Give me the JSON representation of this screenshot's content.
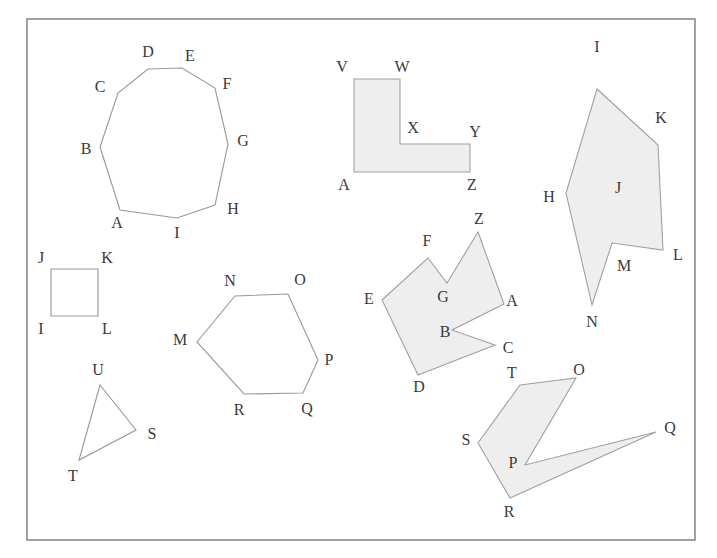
{
  "canvas": {
    "width": 717,
    "height": 558,
    "background": "#ffffff"
  },
  "frame": {
    "name": "diagram-border",
    "x": 27,
    "y": 19,
    "width": 668,
    "height": 521,
    "stroke": "#8a8a8a"
  },
  "style": {
    "outline_stroke": "#9a9a9a",
    "filled_fill": "#eeeeee",
    "filled_stroke": "#a0a0a0",
    "label_color": "#3a3a3a",
    "label_font_size": 16
  },
  "figures": [
    {
      "id": "nonagon",
      "name": "nonagon-outline",
      "filled": false,
      "vertices": [
        {
          "label": "A",
          "x": 120,
          "y": 210,
          "lx": 117,
          "ly": 224
        },
        {
          "label": "B",
          "x": 100,
          "y": 147,
          "lx": 86,
          "ly": 150
        },
        {
          "label": "C",
          "x": 118,
          "y": 93,
          "lx": 100,
          "ly": 88
        },
        {
          "label": "D",
          "x": 148,
          "y": 69,
          "lx": 148,
          "ly": 53
        },
        {
          "label": "E",
          "x": 182,
          "y": 68,
          "lx": 190,
          "ly": 57
        },
        {
          "label": "F",
          "x": 215,
          "y": 88,
          "lx": 227,
          "ly": 85
        },
        {
          "label": "G",
          "x": 228,
          "y": 144,
          "lx": 243,
          "ly": 142
        },
        {
          "label": "H",
          "x": 215,
          "y": 205,
          "lx": 233,
          "ly": 210
        },
        {
          "label": "I",
          "x": 177,
          "y": 218,
          "lx": 177,
          "ly": 234
        }
      ]
    },
    {
      "id": "l-shape",
      "name": "l-shape-filled",
      "filled": true,
      "vertices": [
        {
          "label": "V",
          "x": 354,
          "y": 79,
          "lx": 342,
          "ly": 68
        },
        {
          "label": "W",
          "x": 400,
          "y": 79,
          "lx": 402,
          "ly": 68
        },
        {
          "label": "X",
          "x": 400,
          "y": 144,
          "lx": 413,
          "ly": 129
        },
        {
          "label": "Y",
          "x": 470,
          "y": 144,
          "lx": 475,
          "ly": 133
        },
        {
          "label": "Z",
          "x": 470,
          "y": 172,
          "lx": 472,
          "ly": 186
        },
        {
          "label": "A",
          "x": 354,
          "y": 172,
          "lx": 344,
          "ly": 186
        }
      ]
    },
    {
      "id": "arrow-concave",
      "name": "arrow-concave-filled",
      "filled": true,
      "vertices": [
        {
          "label": "I",
          "x": 597,
          "y": 89,
          "lx": 597,
          "ly": 48
        },
        {
          "label": "K",
          "x": 658,
          "y": 145,
          "lx": 661,
          "ly": 119
        },
        {
          "label": "L",
          "x": 663,
          "y": 250,
          "lx": 678,
          "ly": 256
        },
        {
          "label": "M",
          "x": 612,
          "y": 243,
          "lx": 624,
          "ly": 267
        },
        {
          "label": "N",
          "x": 592,
          "y": 305,
          "lx": 592,
          "ly": 323
        },
        {
          "label": "H",
          "x": 566,
          "y": 193,
          "lx": 549,
          "ly": 198
        }
      ],
      "inner_label": {
        "label": "J",
        "lx": 618,
        "ly": 189
      }
    },
    {
      "id": "square",
      "name": "square-outline",
      "filled": false,
      "vertices": [
        {
          "label": "J",
          "x": 51,
          "y": 269,
          "lx": 41,
          "ly": 259
        },
        {
          "label": "K",
          "x": 98,
          "y": 269,
          "lx": 107,
          "ly": 259
        },
        {
          "label": "L",
          "x": 98,
          "y": 316,
          "lx": 107,
          "ly": 330
        },
        {
          "label": "I",
          "x": 51,
          "y": 316,
          "lx": 41,
          "ly": 330
        }
      ]
    },
    {
      "id": "triangle",
      "name": "triangle-outline",
      "filled": false,
      "vertices": [
        {
          "label": "U",
          "x": 100,
          "y": 385,
          "lx": 98,
          "ly": 371
        },
        {
          "label": "S",
          "x": 136,
          "y": 430,
          "lx": 152,
          "ly": 435
        },
        {
          "label": "T",
          "x": 79,
          "y": 460,
          "lx": 73,
          "ly": 477
        }
      ]
    },
    {
      "id": "hexagon",
      "name": "hexagon-outline",
      "filled": false,
      "vertices": [
        {
          "label": "M",
          "x": 197,
          "y": 342,
          "lx": 180,
          "ly": 341
        },
        {
          "label": "N",
          "x": 235,
          "y": 296,
          "lx": 230,
          "ly": 282
        },
        {
          "label": "O",
          "x": 288,
          "y": 294,
          "lx": 300,
          "ly": 281
        },
        {
          "label": "P",
          "x": 318,
          "y": 360,
          "lx": 329,
          "ly": 361
        },
        {
          "label": "Q",
          "x": 303,
          "y": 393,
          "lx": 307,
          "ly": 410
        },
        {
          "label": "R",
          "x": 244,
          "y": 394,
          "lx": 239,
          "ly": 411
        }
      ]
    },
    {
      "id": "star-polygon",
      "name": "star-polygon-filled",
      "filled": true,
      "vertices": [
        {
          "label": "Z",
          "x": 478,
          "y": 232,
          "lx": 479,
          "ly": 220
        },
        {
          "label": "F",
          "x": 428,
          "y": 258,
          "lx": 427,
          "ly": 242
        },
        {
          "label": "G",
          "x": 447,
          "y": 283,
          "lx": 443,
          "ly": 298
        },
        {
          "label": "E",
          "x": 382,
          "y": 300,
          "lx": 369,
          "ly": 300
        },
        {
          "label": "D",
          "x": 418,
          "y": 375,
          "lx": 419,
          "ly": 388
        },
        {
          "label": "C",
          "x": 495,
          "y": 345,
          "lx": 508,
          "ly": 349
        },
        {
          "label": "B",
          "x": 452,
          "y": 330,
          "lx": 445,
          "ly": 333
        },
        {
          "label": "A",
          "x": 504,
          "y": 304,
          "lx": 512,
          "ly": 302
        }
      ],
      "path_order": [
        "Z",
        "A",
        "B",
        "C",
        "D",
        "E",
        "F",
        "G"
      ]
    },
    {
      "id": "spike-polygon",
      "name": "spike-polygon-filled",
      "filled": true,
      "vertices": [
        {
          "label": "T",
          "x": 520,
          "y": 385,
          "lx": 512,
          "ly": 374
        },
        {
          "label": "O",
          "x": 576,
          "y": 378,
          "lx": 579,
          "ly": 371
        },
        {
          "label": "P",
          "x": 525,
          "y": 465,
          "lx": 513,
          "ly": 464
        },
        {
          "label": "Q",
          "x": 656,
          "y": 432,
          "lx": 670,
          "ly": 429
        },
        {
          "label": "R",
          "x": 510,
          "y": 498,
          "lx": 509,
          "ly": 513
        },
        {
          "label": "S",
          "x": 478,
          "y": 443,
          "lx": 466,
          "ly": 441
        }
      ],
      "path_order": [
        "T",
        "O",
        "P",
        "Q",
        "R",
        "S"
      ]
    }
  ]
}
